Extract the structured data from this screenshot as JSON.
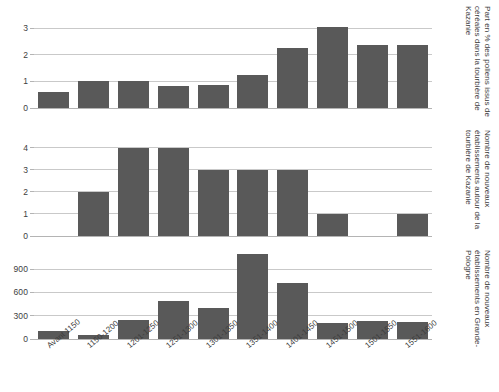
{
  "figure": {
    "name": "three-stacked-bar-charts",
    "background": "#ffffff",
    "bar_color": "#595959",
    "grid_color": "#c9c9c9",
    "text_color": "#3d3d3d"
  },
  "categories": [
    "Avant 1150",
    "1150-1200",
    "1201-1250",
    "1251-1300",
    "1301-1350",
    "1351-1400",
    "1401-1450",
    "1451-1500",
    "1501-1550",
    "1551-1600"
  ],
  "chart_data": [
    {
      "type": "bar",
      "id": "pollen-cereales-kazanie",
      "title": "",
      "xlabel": "",
      "ylabel": "Part en % des pollens issus de céréales dans la tourbière de Kazanie",
      "categories": [
        "Avant 1150",
        "1150-1200",
        "1201-1250",
        "1251-1300",
        "1301-1350",
        "1351-1400",
        "1401-1450",
        "1451-1500",
        "1501-1550",
        "1551-1600"
      ],
      "values": [
        0.6,
        1.0,
        1.0,
        0.82,
        0.88,
        1.25,
        2.25,
        3.05,
        2.35,
        2.37
      ],
      "ylim": [
        0,
        3.3
      ],
      "yticks": [
        0,
        1,
        2,
        3
      ],
      "ytick_labels": [
        "0",
        "1",
        "2",
        "3"
      ],
      "grid": true,
      "legend": "none"
    },
    {
      "type": "bar",
      "id": "nouveaux-etablissements-kazanie",
      "title": "",
      "xlabel": "",
      "ylabel": "Nombre de nouveaux établissements autour de la tourbière de Kazanie",
      "categories": [
        "Avant 1150",
        "1150-1200",
        "1201-1250",
        "1251-1300",
        "1301-1350",
        "1351-1400",
        "1401-1450",
        "1451-1500",
        "1501-1550",
        "1551-1600"
      ],
      "values": [
        0,
        2,
        4,
        4,
        3,
        3,
        3,
        1,
        0,
        1
      ],
      "ylim": [
        0,
        4.4
      ],
      "yticks": [
        0,
        1,
        2,
        3,
        4
      ],
      "ytick_labels": [
        "0",
        "1",
        "2",
        "3",
        "4"
      ],
      "grid": true,
      "legend": "none"
    },
    {
      "type": "bar",
      "id": "nouveaux-etablissements-grande-pologne",
      "title": "",
      "xlabel": "",
      "ylabel": "Nombre de nouveaux établissements en Grande-Pologne",
      "categories": [
        "Avant 1150",
        "1150-1200",
        "1201-1250",
        "1251-1300",
        "1301-1350",
        "1351-1400",
        "1401-1450",
        "1451-1500",
        "1501-1550",
        "1551-1600"
      ],
      "values": [
        100,
        50,
        240,
        490,
        400,
        1090,
        725,
        210,
        230,
        220
      ],
      "ylim": [
        0,
        1120
      ],
      "yticks": [
        0,
        300,
        600,
        900
      ],
      "ytick_labels": [
        "0",
        "300",
        "600",
        "900"
      ],
      "grid": true,
      "legend": "none"
    }
  ]
}
